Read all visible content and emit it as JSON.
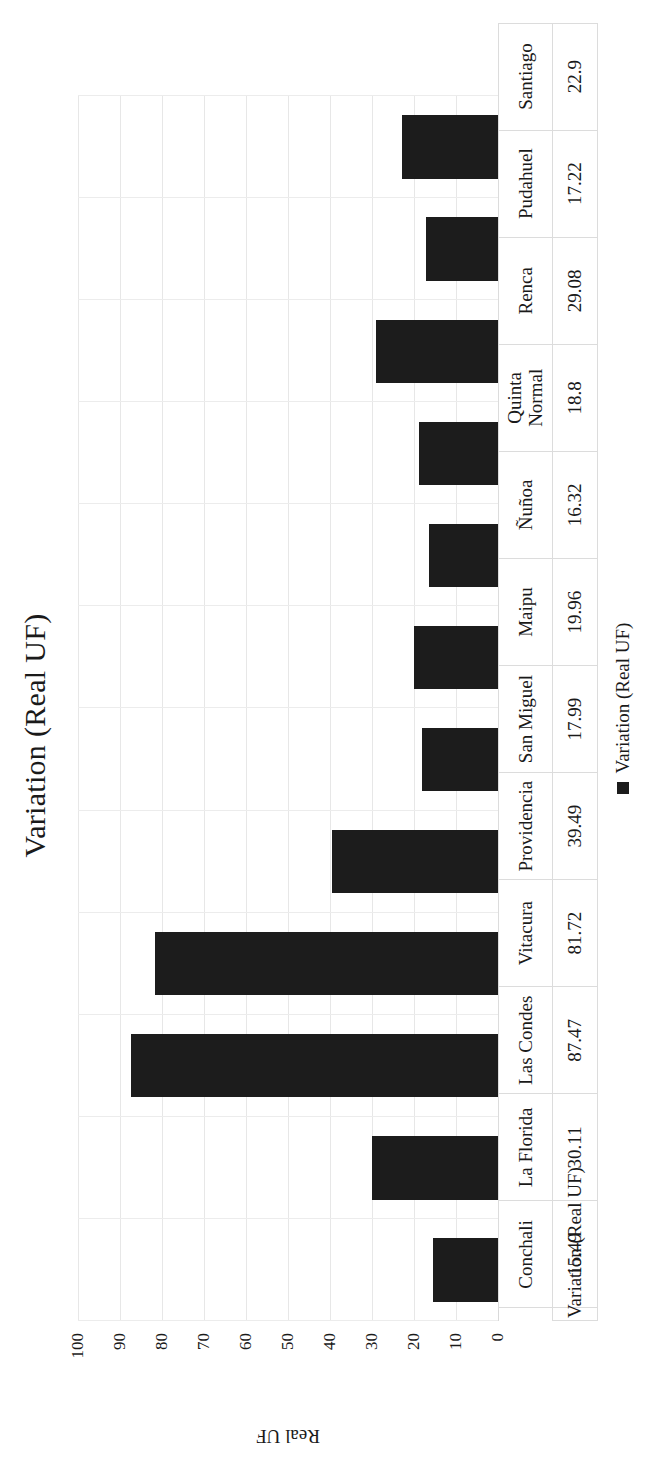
{
  "chart_data": {
    "type": "bar",
    "title": "Variation (Real UF)",
    "xlabel": "",
    "ylabel": "Real UF",
    "ylim": [
      0,
      100
    ],
    "ytick_labels": [
      "100",
      "90",
      "80",
      "70",
      "60",
      "50",
      "40",
      "30",
      "20",
      "10",
      "0"
    ],
    "yticks": [
      100,
      90,
      80,
      70,
      60,
      50,
      40,
      30,
      20,
      10,
      0
    ],
    "grid": true,
    "legend_position": "bottom",
    "legend": [
      "Variation (Real UF)"
    ],
    "series_name": "Variation (Real UF)",
    "bar_color": "#1c1c1c",
    "categories": [
      "Conchali",
      "La Florida",
      "Las Condes",
      "Vitacura",
      "Providencia",
      "San Miguel",
      "Maipu",
      "Ñuñoa",
      "Quinta Normal",
      "Renca",
      "Pudahuel",
      "Santiago"
    ],
    "values": [
      15.49,
      30.11,
      87.47,
      81.72,
      39.49,
      17.99,
      19.96,
      16.32,
      18.8,
      29.08,
      17.22,
      22.9
    ],
    "value_labels": [
      "15.49",
      "30.11",
      "87.47",
      "81.72",
      "39.49",
      "17.99",
      "19.96",
      "16.32",
      "18.8",
      "29.08",
      "17.22",
      "22.9"
    ],
    "data_table_row_header": "Variation (Real UF)"
  },
  "legend": {
    "marker": "square-marker",
    "label": "Variation (Real UF)"
  }
}
